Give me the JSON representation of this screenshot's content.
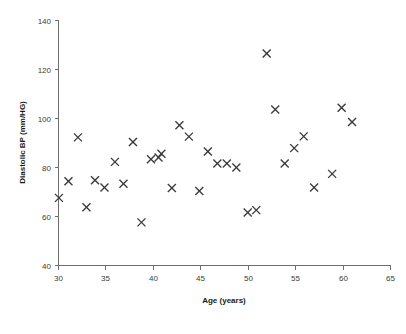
{
  "chart_data": {
    "type": "scatter",
    "title": "",
    "xlabel": "Age (years)",
    "ylabel": "Diastolic BP (mm/HG)",
    "xlim": [
      30,
      65
    ],
    "ylim": [
      40,
      140
    ],
    "xticks": [
      30,
      35,
      40,
      45,
      50,
      55,
      60,
      65
    ],
    "yticks": [
      40,
      60,
      80,
      100,
      120,
      140
    ],
    "xtick_labels": [
      "30",
      "35",
      "40",
      "45",
      "50",
      "55",
      "60",
      "65"
    ],
    "ytick_labels": [
      "40",
      "60",
      "80",
      "100",
      "120",
      "140"
    ],
    "grid": false,
    "legend": false,
    "legend_position": "none",
    "marker": "x",
    "marker_color": "#3a3a3a",
    "series": [
      {
        "name": "Diastolic BP vs Age",
        "points": [
          {
            "x": 30.1,
            "y": 67.4
          },
          {
            "x": 31.1,
            "y": 74.2
          },
          {
            "x": 32.1,
            "y": 92.1
          },
          {
            "x": 33.0,
            "y": 63.6
          },
          {
            "x": 33.9,
            "y": 74.6
          },
          {
            "x": 34.9,
            "y": 71.6
          },
          {
            "x": 36.0,
            "y": 82.1
          },
          {
            "x": 36.9,
            "y": 73.2
          },
          {
            "x": 37.9,
            "y": 90.2
          },
          {
            "x": 38.8,
            "y": 57.4
          },
          {
            "x": 39.8,
            "y": 83.2
          },
          {
            "x": 40.6,
            "y": 83.9
          },
          {
            "x": 40.9,
            "y": 85.4
          },
          {
            "x": 42.0,
            "y": 71.4
          },
          {
            "x": 42.8,
            "y": 97.0
          },
          {
            "x": 43.8,
            "y": 92.4
          },
          {
            "x": 44.9,
            "y": 70.2
          },
          {
            "x": 45.8,
            "y": 86.3
          },
          {
            "x": 46.8,
            "y": 81.4
          },
          {
            "x": 47.8,
            "y": 81.4
          },
          {
            "x": 48.8,
            "y": 79.8
          },
          {
            "x": 50.0,
            "y": 61.4
          },
          {
            "x": 50.9,
            "y": 62.4
          },
          {
            "x": 52.0,
            "y": 126.3
          },
          {
            "x": 52.9,
            "y": 103.5
          },
          {
            "x": 53.9,
            "y": 81.4
          },
          {
            "x": 54.9,
            "y": 87.7
          },
          {
            "x": 55.9,
            "y": 92.5
          },
          {
            "x": 57.0,
            "y": 71.6
          },
          {
            "x": 58.9,
            "y": 77.2
          },
          {
            "x": 59.9,
            "y": 104.2
          },
          {
            "x": 61.0,
            "y": 98.4
          }
        ]
      }
    ]
  },
  "geometry": {
    "plot_left": 58,
    "plot_right": 390,
    "plot_top": 20,
    "plot_bottom": 265,
    "tick_len": 4,
    "marker_half": 4
  }
}
